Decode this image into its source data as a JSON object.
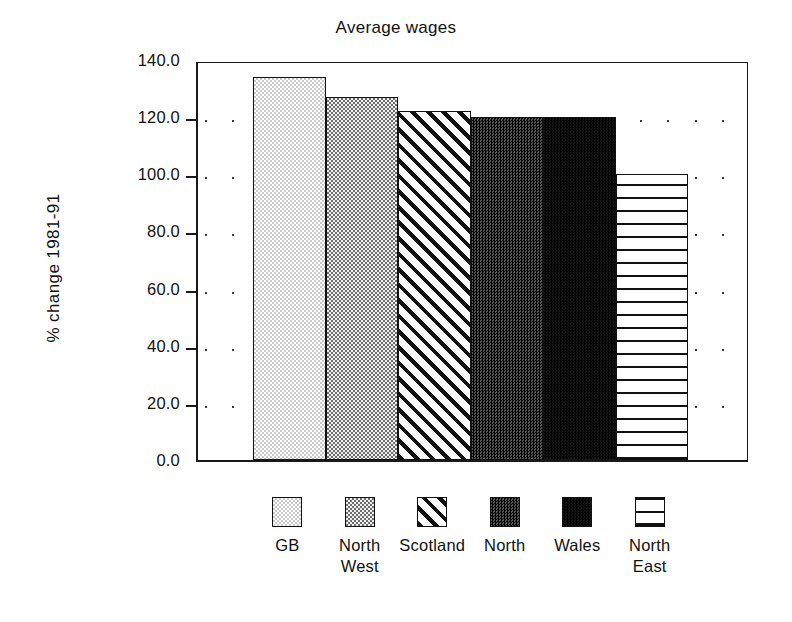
{
  "chart_data": {
    "type": "bar",
    "title": "Average wages",
    "xlabel": "",
    "ylabel": "% change 1981-91",
    "ylim": [
      0.0,
      140.0
    ],
    "ytick_values": [
      0.0,
      20.0,
      40.0,
      60.0,
      80.0,
      100.0,
      120.0,
      140.0
    ],
    "ytick_labels": [
      "0.0",
      "20.0",
      "40.0",
      "60.0",
      "80.0",
      "100.0",
      "120.0",
      "140.0"
    ],
    "grid": true,
    "grid_style": "dotted",
    "legend_position": "bottom",
    "categories": [
      "GB",
      "North West",
      "Scotland",
      "North",
      "Wales",
      "North East"
    ],
    "values": [
      134.0,
      127.0,
      122.0,
      120.0,
      120.0,
      100.0
    ],
    "series": [
      {
        "name": "Average wages",
        "values": [
          134.0,
          127.0,
          122.0,
          120.0,
          120.0,
          100.0
        ]
      }
    ],
    "bars": [
      {
        "label": "GB",
        "label_lines": "GB",
        "value": 134.0,
        "pattern": "light-checker"
      },
      {
        "label": "North West",
        "label_lines": "North\nWest",
        "value": 127.0,
        "pattern": "medium-checker"
      },
      {
        "label": "Scotland",
        "label_lines": "Scotland",
        "value": 122.0,
        "pattern": "diagonal-stripes"
      },
      {
        "label": "North",
        "label_lines": "North",
        "value": 120.0,
        "pattern": "dark-checker"
      },
      {
        "label": "Wales",
        "label_lines": "Wales",
        "value": 120.0,
        "pattern": "solid-black"
      },
      {
        "label": "North East",
        "label_lines": "North\nEast",
        "value": 100.0,
        "pattern": "crosshatch-grid"
      }
    ],
    "colors": {
      "axis": "#1a1a1a",
      "text": "#111111",
      "background": "#ffffff",
      "grid_dot": "#3a3a3a"
    }
  }
}
